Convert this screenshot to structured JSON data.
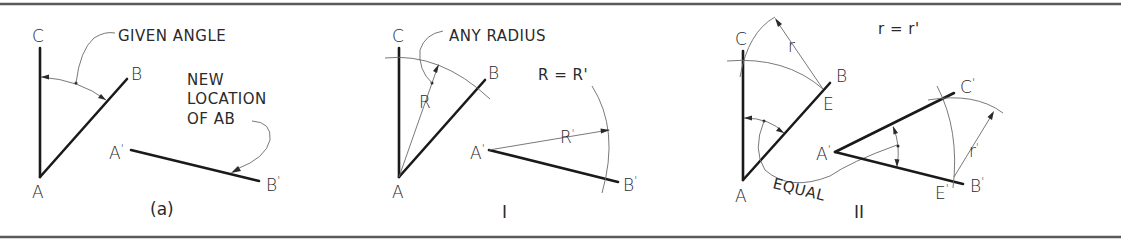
{
  "figure": {
    "panels": [
      {
        "id": "a",
        "caption": "(a)",
        "points": {
          "A": "A",
          "B": "B",
          "C": "C",
          "A1": "A",
          "B1": "B"
        },
        "prime": "'",
        "notes": {
          "given_angle": "GIVEN ANGLE",
          "new_location_1": "NEW",
          "new_location_2": "LOCATION",
          "new_location_3": "OF AB"
        }
      },
      {
        "id": "I",
        "caption": "I",
        "points": {
          "A": "A",
          "B": "B",
          "C": "C",
          "A1": "A",
          "B1": "B"
        },
        "prime": "'",
        "notes": {
          "any_radius": "ANY RADIUS",
          "radius_label": "R",
          "radius_prime_label": "R'",
          "equation": "R = R'"
        }
      },
      {
        "id": "II",
        "caption": "II",
        "points": {
          "A": "A",
          "B": "B",
          "C": "C",
          "E": "E",
          "A1": "A",
          "B1": "B",
          "C1": "C",
          "E1": "E"
        },
        "prime": "'",
        "notes": {
          "r_label": "r",
          "r_prime_label": "r'",
          "equation": "r = r'",
          "equal": "EQUAL"
        }
      }
    ]
  },
  "colors": {
    "line": "#1a1a1a",
    "construction": "#6a6a6a",
    "rule": "#5a5a5a",
    "background": "#ffffff"
  }
}
